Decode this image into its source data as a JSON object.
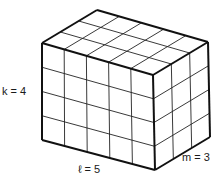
{
  "diagram": {
    "type": "rectangular-prism-unit-cubes",
    "labels": {
      "height": "k = 4",
      "length": "ℓ = 5",
      "width": "m = 3"
    },
    "dimensions": {
      "length": 5,
      "height": 4,
      "width": 3
    },
    "colors": {
      "stroke": "#111111",
      "fill": "#ffffff"
    }
  }
}
